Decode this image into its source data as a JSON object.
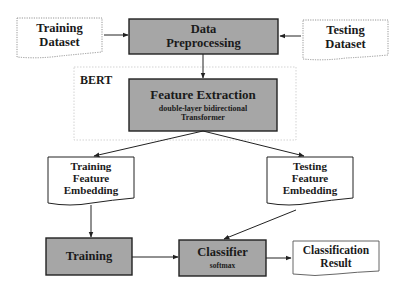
{
  "diagram": {
    "nodes": {
      "training_dataset": {
        "line1": "Training",
        "line2": "Dataset"
      },
      "data_preprocessing": {
        "line1": "Data",
        "line2": "Preprocessing"
      },
      "testing_dataset": {
        "line1": "Testing",
        "line2": "Dataset"
      },
      "bert": {
        "label": "BERT"
      },
      "feature_extraction": {
        "title": "Feature Extraction",
        "sub1": "double-layer bidirectional",
        "sub2": "Transformer"
      },
      "training_feature_embedding": {
        "line1": "Training",
        "line2": "Feature",
        "line3": "Embedding"
      },
      "testing_feature_embedding": {
        "line1": "Testing",
        "line2": "Feature",
        "line3": "Embedding"
      },
      "training": {
        "label": "Training"
      },
      "classifier": {
        "title": "Classifier",
        "sub": "softmax"
      },
      "classification_result": {
        "line1": "Classification",
        "line2": "Result"
      }
    },
    "edges": [
      {
        "from": "training_dataset",
        "to": "data_preprocessing"
      },
      {
        "from": "testing_dataset",
        "to": "data_preprocessing"
      },
      {
        "from": "data_preprocessing",
        "to": "feature_extraction"
      },
      {
        "from": "feature_extraction",
        "to": "training_feature_embedding"
      },
      {
        "from": "feature_extraction",
        "to": "testing_feature_embedding"
      },
      {
        "from": "training_feature_embedding",
        "to": "training"
      },
      {
        "from": "testing_feature_embedding",
        "to": "classifier"
      },
      {
        "from": "training",
        "to": "classifier"
      },
      {
        "from": "classifier",
        "to": "classification_result"
      }
    ],
    "colors": {
      "process_fill": "#a6a6a6",
      "border": "#222222",
      "dotted_border": "#9a9a9a"
    }
  }
}
